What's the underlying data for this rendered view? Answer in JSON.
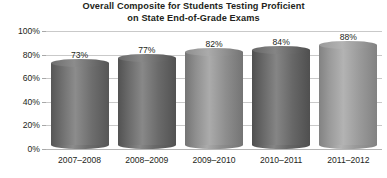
{
  "chart_data": {
    "type": "bar",
    "title": "Overall Composite for Students Testing Proficient on State End-of-Grade Exams",
    "title_lines": [
      "Overall Composite for Students Testing Proficient",
      "on State End-of-Grade Exams"
    ],
    "categories": [
      "2007–2008",
      "2008–2009",
      "2009–2010",
      "2010–2011",
      "2011–2012"
    ],
    "values": [
      73,
      77,
      82,
      84,
      88
    ],
    "value_labels": [
      "73%",
      "77%",
      "82%",
      "84%",
      "88%"
    ],
    "xlabel": "",
    "ylabel": "",
    "ylim": [
      0,
      100
    ],
    "ytick_values": [
      100,
      80,
      60,
      40,
      20,
      0
    ],
    "ytick_labels": [
      "100%",
      "80%",
      "60%",
      "40%",
      "20%",
      "0%"
    ],
    "grid": true,
    "legend": false,
    "legend_position": "none",
    "bar_style": "3d-cylinder",
    "bar_colors": [
      "#6e6e6e",
      "#6a6a6a",
      "#8e8e8e",
      "#676767",
      "#9a9a9a"
    ],
    "bar_colors_light": [
      "#8c8c8c",
      "#888888",
      "#ababab",
      "#858585",
      "#b3b3b3"
    ],
    "bar_colors_dark": [
      "#565656",
      "#525252",
      "#747474",
      "#4f4f4f",
      "#828282"
    ],
    "background_color": "#ffffff",
    "grid_color": "#c9c9c9",
    "text_color": "#231f20"
  }
}
